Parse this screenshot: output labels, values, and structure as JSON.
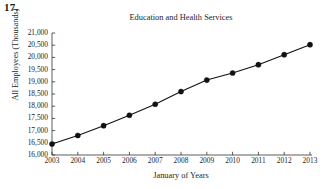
{
  "problem": {
    "number": "17."
  },
  "chart_data": {
    "type": "line",
    "title": "Education and Health Services",
    "xlabel": "January of Years",
    "ylabel": "All Employees (Thousands)",
    "categories": [
      "2003",
      "2004",
      "2005",
      "2006",
      "2007",
      "2008",
      "2009",
      "2010",
      "2011",
      "2012",
      "2013"
    ],
    "x": [
      2003,
      2004,
      2005,
      2006,
      2007,
      2008,
      2009,
      2010,
      2011,
      2012,
      2013
    ],
    "values": [
      16450,
      16800,
      17200,
      17630,
      18080,
      18600,
      19070,
      19360,
      19700,
      20110,
      20520
    ],
    "ylim": [
      16000,
      21000
    ],
    "xlim": [
      2003,
      2013
    ],
    "ytick_labels": [
      "16,000",
      "16,500",
      "17,000",
      "17,500",
      "18,000",
      "18,500",
      "19,000",
      "19,500",
      "20,000",
      "20,500",
      "21,000"
    ],
    "ytick_values": [
      16000,
      16500,
      17000,
      17500,
      18000,
      18500,
      19000,
      19500,
      20000,
      20500,
      21000
    ],
    "xtick_labels": [
      "2003",
      "2004",
      "2005",
      "2006",
      "2007",
      "2008",
      "2009",
      "2010",
      "2011",
      "2012",
      "2013"
    ],
    "grid": false,
    "legend": null,
    "series_color": "#111111",
    "marker": "filled-circle",
    "line_width": 1.1,
    "marker_size": 2.6
  },
  "axes": {
    "left_px": 52,
    "right_px": 310,
    "top_px": 33,
    "bottom_px": 155
  }
}
